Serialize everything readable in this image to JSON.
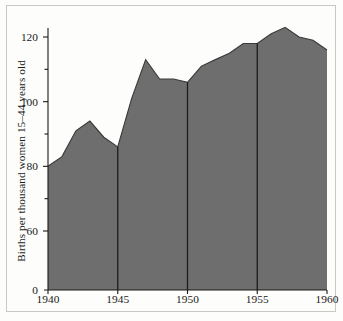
{
  "chart_data": {
    "type": "area",
    "title": "",
    "subtitle": "",
    "xlabel": "",
    "ylabel": "Births per thousand women 15–44 years old",
    "x": [
      1940,
      1941,
      1942,
      1943,
      1944,
      1945,
      1946,
      1947,
      1948,
      1949,
      1950,
      1951,
      1952,
      1953,
      1954,
      1955,
      1956,
      1957,
      1958,
      1959,
      1960
    ],
    "values": [
      80,
      83,
      91,
      94,
      89,
      86,
      101,
      113,
      107,
      107,
      106,
      111,
      113,
      115,
      118,
      118,
      121,
      123,
      120,
      119,
      116
    ],
    "series": [
      {
        "name": "Birth rate",
        "values": [
          80,
          83,
          91,
          94,
          89,
          86,
          101,
          113,
          107,
          107,
          106,
          111,
          113,
          115,
          118,
          118,
          121,
          123,
          120,
          119,
          116
        ]
      }
    ],
    "ylim": [
      0,
      128
    ],
    "xlim": [
      1940,
      1960
    ],
    "y_axis_break": true,
    "y_axis_break_between": [
      0,
      60
    ],
    "ytick_labels": [
      "0",
      "60",
      "80",
      "100",
      "120"
    ],
    "ytick_values": [
      0,
      60,
      80,
      100,
      120
    ],
    "yminor_tick_values": [
      70,
      90,
      110
    ],
    "xtick_labels": [
      "1940",
      "1945",
      "1950",
      "1955",
      "1960"
    ],
    "xtick_values": [
      1940,
      1945,
      1950,
      1955,
      1960
    ],
    "vertical_rule_years": [
      1945,
      1950,
      1955
    ],
    "grid": false,
    "legend": "none",
    "colors": {
      "area_fill": "#6e6e6e",
      "area_edge": "#3a3a3a",
      "axis": "#1a1a1a",
      "vertical_rule": "#1c1c1c",
      "frame_border": "#c9c9c4",
      "background": "#fdfdfb",
      "text": "#1a1a1a"
    }
  },
  "axis": {
    "y_label": "Births per thousand women 15–44 years old",
    "y_ticks": [
      {
        "label": "120",
        "value": 120
      },
      {
        "label": "100",
        "value": 100
      },
      {
        "label": "80",
        "value": 80
      },
      {
        "label": "60",
        "value": 60
      },
      {
        "label": "0",
        "value": 0
      }
    ],
    "x_ticks": [
      {
        "label": "1940",
        "value": 1940
      },
      {
        "label": "1945",
        "value": 1945
      },
      {
        "label": "1950",
        "value": 1950
      },
      {
        "label": "1955",
        "value": 1955
      },
      {
        "label": "1960",
        "value": 1960
      }
    ]
  }
}
